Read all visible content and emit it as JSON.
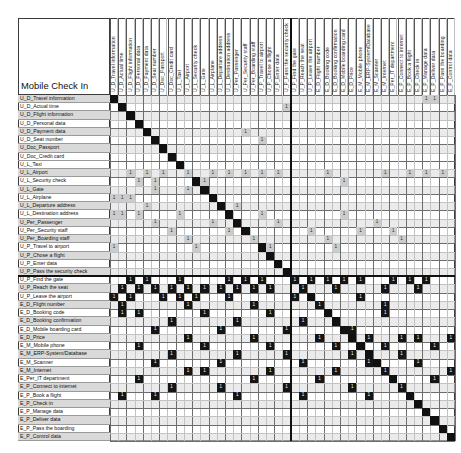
{
  "chart_data": {
    "type": "heatmap",
    "title": "Mobile Check In",
    "subtype": "design-structure-matrix",
    "xlabel": "",
    "ylabel": "",
    "grid": true,
    "legend_position": "none",
    "axis_labels_identical": true,
    "n_rows": 44,
    "n_cols": 44,
    "diagonal_color": "#111111",
    "upper_block_color": "#cccccc",
    "lower_block_color": "#151515",
    "mark_value": "1",
    "divider_after_index": 21,
    "categories": [
      "U_D_Travel information",
      "U_D_Actual time",
      "U_D_Flight information",
      "U_D_Personal data",
      "U_D_Payment data",
      "U_D_Seat number",
      "U_Doc_Passport",
      "U_Doc_Credit card",
      "U_L_Taxi",
      "U_L_Airport",
      "U_L_Security check",
      "U_L_Gate",
      "U_L_Airplane",
      "U_L_Departure address",
      "U_L_Destination address",
      "U_Per_Passenger",
      "U_Per_Security staff",
      "U_Per_Boarding staff",
      "U_P_Travel to airport",
      "U_P_Chose a flight",
      "U_P_Enter data",
      "U_P_Pass the security check",
      "U_P_Find the gate",
      "U_P_Reach the seat",
      "U_P_Leave the airport",
      "E_D_Flight number",
      "E_D_Booking code",
      "E_D_Booking confirmation",
      "E_D_Mobile boarding card",
      "E_D_Price",
      "E_M_Mobile phone",
      "E_M_ERP-System/Database",
      "E_M_Scanner",
      "E_M_Internet",
      "E_Per_IT department",
      "E_P_Connect to internet",
      "E_P_Book a flight",
      "E_P_Check in",
      "E_P_Manage data",
      "E_P_Deliver data",
      "E_P_Pass the boarding",
      "E_P_Control data"
    ],
    "shaded_rows": [
      0,
      2,
      4,
      6,
      9,
      11,
      13,
      15,
      17,
      19,
      21,
      23,
      25,
      27,
      29,
      31,
      33,
      35,
      37,
      39,
      41
    ],
    "band_rows": [
      0,
      2,
      4,
      6,
      9,
      11,
      13,
      15,
      17,
      19,
      21,
      23,
      25,
      27,
      29,
      31,
      33,
      35,
      37,
      39,
      41
    ],
    "marks_light": [
      [
        0,
        38
      ],
      [
        0,
        39
      ],
      [
        1,
        21
      ],
      [
        2,
        42
      ],
      [
        4,
        16
      ],
      [
        5,
        18
      ],
      [
        9,
        2
      ],
      [
        9,
        4
      ],
      [
        9,
        6
      ],
      [
        9,
        9
      ],
      [
        9,
        12
      ],
      [
        9,
        14
      ],
      [
        9,
        16
      ],
      [
        9,
        18
      ],
      [
        9,
        20
      ],
      [
        9,
        26
      ],
      [
        9,
        33
      ],
      [
        9,
        36
      ],
      [
        9,
        38
      ],
      [
        9,
        40
      ],
      [
        10,
        3
      ],
      [
        10,
        5
      ],
      [
        10,
        11
      ],
      [
        10,
        28
      ],
      [
        11,
        5
      ],
      [
        11,
        9
      ],
      [
        12,
        0
      ],
      [
        12,
        1
      ],
      [
        12,
        2
      ],
      [
        13,
        4
      ],
      [
        13,
        15
      ],
      [
        14,
        0
      ],
      [
        14,
        1
      ],
      [
        14,
        3
      ],
      [
        14,
        8
      ],
      [
        14,
        18
      ],
      [
        14,
        28
      ],
      [
        15,
        5
      ],
      [
        15,
        12
      ],
      [
        15,
        20
      ],
      [
        15,
        32
      ],
      [
        16,
        7
      ],
      [
        16,
        14
      ],
      [
        16,
        24
      ],
      [
        16,
        30
      ],
      [
        16,
        34
      ],
      [
        17,
        9
      ],
      [
        17,
        17
      ],
      [
        17,
        26
      ],
      [
        17,
        35
      ],
      [
        18,
        0
      ],
      [
        18,
        10
      ],
      [
        18,
        19
      ],
      [
        18,
        27
      ]
    ],
    "marks_dark": [
      [
        22,
        2
      ],
      [
        22,
        4
      ],
      [
        22,
        8
      ],
      [
        22,
        14
      ],
      [
        22,
        16
      ],
      [
        22,
        18
      ],
      [
        22,
        22
      ],
      [
        22,
        24
      ],
      [
        22,
        26
      ],
      [
        22,
        28
      ],
      [
        22,
        30
      ],
      [
        22,
        34
      ],
      [
        22,
        36
      ],
      [
        22,
        38
      ],
      [
        23,
        1
      ],
      [
        23,
        3
      ],
      [
        23,
        5
      ],
      [
        23,
        7
      ],
      [
        23,
        9
      ],
      [
        23,
        11
      ],
      [
        23,
        13
      ],
      [
        23,
        15
      ],
      [
        23,
        17
      ],
      [
        23,
        19
      ],
      [
        23,
        23
      ],
      [
        23,
        27
      ],
      [
        23,
        33
      ],
      [
        23,
        37
      ],
      [
        24,
        0
      ],
      [
        24,
        2
      ],
      [
        24,
        6
      ],
      [
        24,
        8
      ],
      [
        24,
        10
      ],
      [
        24,
        14
      ],
      [
        24,
        22
      ],
      [
        24,
        30
      ],
      [
        24,
        42
      ],
      [
        25,
        1
      ],
      [
        25,
        9
      ],
      [
        25,
        17
      ],
      [
        25,
        25
      ],
      [
        25,
        33
      ],
      [
        26,
        1
      ],
      [
        26,
        3
      ],
      [
        26,
        11
      ],
      [
        26,
        19
      ],
      [
        26,
        33
      ],
      [
        27,
        7
      ],
      [
        27,
        15
      ],
      [
        27,
        23
      ],
      [
        28,
        5
      ],
      [
        28,
        13
      ],
      [
        28,
        21
      ],
      [
        28,
        29
      ],
      [
        29,
        9
      ],
      [
        29,
        17
      ],
      [
        29,
        25
      ],
      [
        29,
        31
      ],
      [
        29,
        35
      ],
      [
        29,
        37
      ],
      [
        29,
        41
      ],
      [
        30,
        3
      ],
      [
        30,
        11
      ],
      [
        30,
        19
      ],
      [
        30,
        27
      ],
      [
        30,
        33
      ],
      [
        30,
        39
      ],
      [
        31,
        7
      ],
      [
        31,
        15
      ],
      [
        31,
        21
      ],
      [
        31,
        29
      ],
      [
        31,
        35
      ],
      [
        32,
        5
      ],
      [
        32,
        13
      ],
      [
        32,
        23
      ],
      [
        32,
        31
      ],
      [
        32,
        37
      ],
      [
        33,
        9
      ],
      [
        33,
        11
      ],
      [
        33,
        19
      ],
      [
        33,
        27
      ],
      [
        33,
        33
      ],
      [
        33,
        41
      ],
      [
        34,
        3
      ],
      [
        34,
        17
      ],
      [
        34,
        25
      ],
      [
        34,
        39
      ],
      [
        35,
        7
      ],
      [
        35,
        13
      ],
      [
        35,
        21
      ],
      [
        35,
        29
      ],
      [
        35,
        35
      ],
      [
        35,
        43
      ],
      [
        36,
        1
      ],
      [
        36,
        5
      ],
      [
        36,
        15
      ],
      [
        36,
        23
      ],
      [
        36,
        31
      ]
    ]
  }
}
